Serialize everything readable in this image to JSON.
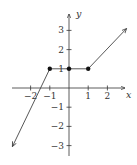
{
  "chart_data": {
    "type": "line",
    "title": "",
    "xlabel": "x",
    "ylabel": "y",
    "xlim": [
      -3,
      3.2
    ],
    "ylim": [
      -3.5,
      3.9
    ],
    "grid": false,
    "legend": null,
    "x_ticks": [
      -2,
      -1,
      1,
      2
    ],
    "x_tick_labels": [
      "−2",
      "−1",
      "1",
      "2"
    ],
    "y_ticks": [
      3,
      2,
      1,
      -1,
      -2,
      -3
    ],
    "y_tick_labels": [
      "3",
      "2",
      "1",
      "−1",
      "−2",
      "−3"
    ],
    "series": [
      {
        "name": "left-ray",
        "points": [
          [
            -1,
            1
          ],
          [
            -2.95,
            -3.05
          ]
        ],
        "end_arrow": true,
        "note": "slope 3, extends to -infinity"
      },
      {
        "name": "middle-segment",
        "points": [
          [
            -1,
            1
          ],
          [
            0,
            1
          ],
          [
            1,
            1
          ]
        ],
        "end_arrow": false
      },
      {
        "name": "right-ray",
        "points": [
          [
            1,
            1
          ],
          [
            3,
            3.1
          ]
        ],
        "end_arrow": true,
        "note": "slope 1, extends to +infinity"
      }
    ],
    "marked_points": [
      [
        -1,
        1
      ],
      [
        0,
        1
      ],
      [
        1,
        1
      ]
    ]
  },
  "labels": {
    "x_axis": "x",
    "y_axis": "y",
    "x_ticks": [
      "−2",
      "−1",
      "1",
      "2"
    ],
    "y_ticks": [
      "3",
      "2",
      "1",
      "−1",
      "−2",
      "−3"
    ]
  },
  "colors": {
    "axis": "#333333",
    "curve": "#444444",
    "dot": "#111111"
  }
}
